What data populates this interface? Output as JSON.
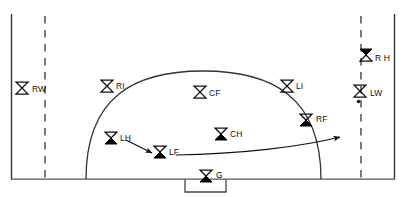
{
  "diagram": {
    "field": {
      "shape": "rectangle",
      "border_color": "#333333",
      "dashed_line_color": "#333333",
      "arc_name": "shooting-circle",
      "goal_box_name": "goal-box"
    },
    "colors": {
      "ink": "#111111",
      "line": "#333333",
      "fill": "#000000",
      "background": "#ffffff"
    },
    "players": [
      {
        "id": "RW",
        "label": "RW",
        "marker": "hollow-hourglass",
        "x": 22,
        "y": 88,
        "label_dx": 10,
        "label_dy": -3
      },
      {
        "id": "RI",
        "label": "RI",
        "marker": "hollow-hourglass",
        "x": 107,
        "y": 86,
        "label_dx": 9,
        "label_dy": -4
      },
      {
        "id": "CF",
        "label": "CF",
        "marker": "hollow-hourglass",
        "x": 200,
        "y": 92,
        "label_dx": 9,
        "label_dy": -3
      },
      {
        "id": "LI",
        "label": "LI",
        "marker": "hollow-hourglass",
        "x": 287,
        "y": 86,
        "label_dx": 9,
        "label_dy": -4
      },
      {
        "id": "LW",
        "label": "LW",
        "marker": "hollow-hourglass-dot",
        "x": 360,
        "y": 91,
        "label_dx": 10,
        "label_dy": -2
      },
      {
        "id": "RH",
        "label": "R H",
        "marker": "filled-hourglass",
        "x": 366,
        "y": 55,
        "label_dx": 9,
        "label_dy": -1
      },
      {
        "id": "RF",
        "label": "RF",
        "marker": "filled-hourglass",
        "x": 306,
        "y": 120,
        "label_dx": 10,
        "label_dy": -5
      },
      {
        "id": "CH",
        "label": "CH",
        "marker": "filled-hourglass",
        "x": 221,
        "y": 134,
        "label_dx": 9,
        "label_dy": -4
      },
      {
        "id": "LH",
        "label": "LH",
        "marker": "filled-hourglass",
        "x": 111,
        "y": 138,
        "label_dx": 9,
        "label_dy": -4
      },
      {
        "id": "LF",
        "label": "LF",
        "marker": "filled-hourglass",
        "x": 160,
        "y": 152,
        "label_dx": 9,
        "label_dy": -4
      },
      {
        "id": "G",
        "label": "G",
        "marker": "filled-hourglass",
        "x": 206,
        "y": 176,
        "label_dx": 9,
        "label_dy": -5
      }
    ],
    "arrows": [
      {
        "id": "lh-to-lf",
        "name": "pass-arrow-lh-to-lf",
        "from": "LH",
        "to": "LF",
        "style": "straight"
      },
      {
        "id": "lf-to-right",
        "name": "run-arrow-lf-to-right",
        "from": "LF",
        "to": "right-side",
        "style": "curved"
      }
    ]
  }
}
